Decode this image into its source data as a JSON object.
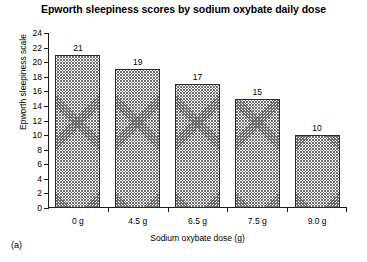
{
  "figure": {
    "subfigure_label": "(a)"
  },
  "chart_data": {
    "type": "bar",
    "title": "Epworth sleepiness scores by sodium oxybate daily dose",
    "xlabel": "Sodium oxybate dose (g)",
    "ylabel": "Epworth sleepiness scale",
    "categories": [
      "0 g",
      "4.5 g",
      "6.5 g",
      "7.5 g",
      "9.0 g"
    ],
    "values": [
      21,
      19,
      17,
      15,
      10
    ],
    "value_labels": [
      "21",
      "19",
      "17",
      "15",
      "10"
    ],
    "ylim": [
      0,
      24
    ],
    "ytick_step": 2,
    "yticks": [
      0,
      2,
      4,
      6,
      8,
      10,
      12,
      14,
      16,
      18,
      20,
      22,
      24
    ],
    "ytick_labels": [
      "0",
      "2",
      "4",
      "6",
      "8",
      "10",
      "12",
      "14",
      "16",
      "18",
      "20",
      "22",
      "24"
    ],
    "grid": false,
    "legend": false,
    "bar_fill": "crosshatch",
    "bar_edge_color": "#2b2b2b",
    "axis_color": "#1a1a1a"
  }
}
